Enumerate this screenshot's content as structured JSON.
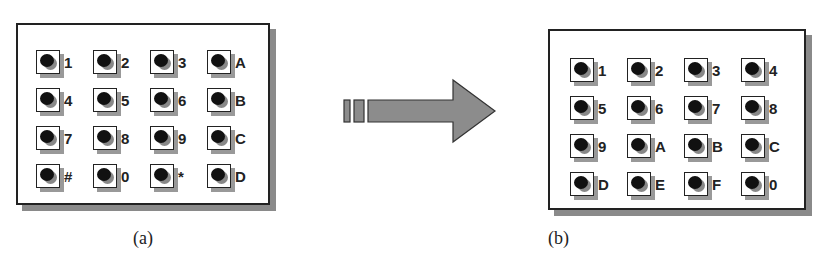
{
  "figure": {
    "panel_a": {
      "caption": "(a)",
      "keys": [
        "1",
        "2",
        "3",
        "A",
        "4",
        "5",
        "6",
        "B",
        "7",
        "8",
        "9",
        "C",
        "#",
        "0",
        "*",
        "D"
      ]
    },
    "panel_b": {
      "caption": "(b)",
      "keys": [
        "1",
        "2",
        "3",
        "4",
        "5",
        "6",
        "7",
        "8",
        "9",
        "A",
        "B",
        "C",
        "D",
        "E",
        "F",
        "0"
      ]
    },
    "arrow": {
      "direction": "right",
      "icon": "right-arrow-icon"
    },
    "colors": {
      "frame": "#222222",
      "shadow": "#8a8a8a",
      "arrow_fill": "#8c8c8c",
      "dot": "#111111"
    }
  }
}
